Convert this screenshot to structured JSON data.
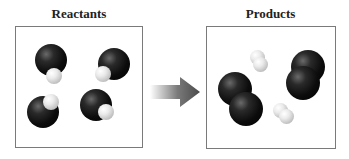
{
  "reactants": {
    "title": "Reactants",
    "molecules": [
      {
        "type": "CO",
        "large": {
          "x": 35,
          "y": 44,
          "d": 32
        },
        "small": {
          "x": 46,
          "y": 68,
          "d": 16
        }
      },
      {
        "type": "CO",
        "large": {
          "x": 98,
          "y": 48,
          "d": 32
        },
        "small": {
          "x": 95,
          "y": 66,
          "d": 16
        }
      },
      {
        "type": "CO",
        "large": {
          "x": 27,
          "y": 96,
          "d": 32
        },
        "small": {
          "x": 43,
          "y": 94,
          "d": 16
        }
      },
      {
        "type": "CO",
        "large": {
          "x": 80,
          "y": 89,
          "d": 32
        },
        "small": {
          "x": 98,
          "y": 104,
          "d": 16
        }
      }
    ]
  },
  "products": {
    "title": "Products",
    "molecules": [
      {
        "type": "dark-diatomic",
        "a": {
          "x": 218,
          "y": 72,
          "d": 34
        },
        "b": {
          "x": 229,
          "y": 92,
          "d": 34
        }
      },
      {
        "type": "dark-diatomic",
        "a": {
          "x": 291,
          "y": 50,
          "d": 34
        },
        "b": {
          "x": 286,
          "y": 66,
          "d": 34
        }
      },
      {
        "type": "light-diatomic",
        "a": {
          "x": 250,
          "y": 50,
          "d": 15
        },
        "b": {
          "x": 253,
          "y": 57,
          "d": 15
        }
      },
      {
        "type": "light-diatomic",
        "a": {
          "x": 273,
          "y": 103,
          "d": 15
        },
        "b": {
          "x": 279,
          "y": 109,
          "d": 15
        }
      }
    ]
  },
  "arrow": {
    "direction": "right",
    "color": "#555555"
  },
  "colors": {
    "border": "#7a7a7a",
    "title": "#222222"
  }
}
